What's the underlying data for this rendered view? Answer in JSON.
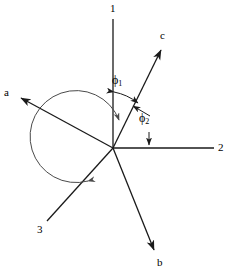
{
  "figure": {
    "type": "vector-axis-diagram",
    "origin": {
      "x": 113,
      "y": 148
    },
    "size": {
      "width": 230,
      "height": 274
    },
    "stroke_color": "#1a1a1a",
    "arc_color": "#555555",
    "background": "#ffffff"
  },
  "axes": [
    {
      "name": "axis-1",
      "label": "1",
      "label_pos": {
        "x": 110,
        "y": 4
      },
      "end": {
        "x": 113,
        "y": 19
      },
      "arrow": false
    },
    {
      "name": "axis-2",
      "label": "2",
      "label_pos": {
        "x": 218,
        "y": 143
      },
      "end": {
        "x": 214,
        "y": 148
      },
      "arrow": false
    },
    {
      "name": "axis-3",
      "label": "3",
      "label_pos": {
        "x": 38,
        "y": 225
      },
      "end": {
        "x": 47,
        "y": 221
      },
      "arrow": false
    }
  ],
  "vectors": [
    {
      "name": "vector-a",
      "label": "a",
      "label_pos": {
        "x": 4,
        "y": 88
      },
      "end": {
        "x": 18,
        "y": 97
      },
      "arrow": true
    },
    {
      "name": "vector-b",
      "label": "b",
      "label_pos": {
        "x": 158,
        "y": 258
      },
      "end": {
        "x": 156,
        "y": 254
      },
      "arrow": true
    },
    {
      "name": "vector-c",
      "label": "c",
      "label_pos": {
        "x": 161,
        "y": 31
      },
      "end": {
        "x": 163,
        "y": 47
      },
      "arrow": true
    }
  ],
  "angles": [
    {
      "name": "angle-phi-1",
      "symbol": "ϕ",
      "subscript": "1",
      "label_pos": {
        "x": 114,
        "y": 76
      },
      "description": "angle between axis 1 and vector c"
    },
    {
      "name": "angle-phi-2",
      "symbol": "ϕ",
      "subscript": "2",
      "label_pos": {
        "x": 140,
        "y": 114
      },
      "description": "angle between vector c and axis 2"
    }
  ],
  "arcs": [
    {
      "name": "arc-phi-1",
      "description": "double headed arc from axis 1 to vector c",
      "radius": 56
    },
    {
      "name": "arc-phi-2-pointer",
      "description": "pointer from phi-2 label up-left to vector c"
    },
    {
      "name": "arc-phi-2-down",
      "description": "pointer from phi-2 label down to axis 2"
    },
    {
      "name": "arc-sweep",
      "description": "large clockwise sweep arc from vector c around to axis 3",
      "radius": 46
    }
  ]
}
